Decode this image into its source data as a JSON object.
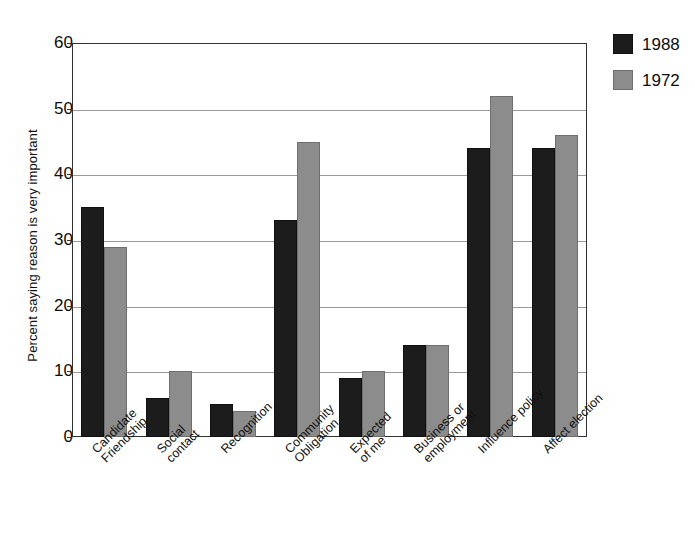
{
  "chart_data": {
    "type": "bar",
    "title": "",
    "xlabel": "",
    "ylabel": "Percent saying reason is very important",
    "ylim": [
      0,
      60
    ],
    "ytick_step": 10,
    "yticks": [
      "0",
      "10",
      "20",
      "30",
      "40",
      "50",
      "60"
    ],
    "grid": true,
    "legend_position": "right-top",
    "categories": [
      "Candidate\nFriendship",
      "Social\ncontact",
      "Recognition",
      "Community\nObligation",
      "Expected\nof me",
      "Business or\nemployment",
      "Influence policy",
      "Affect election"
    ],
    "series": [
      {
        "name": "1988",
        "color": "#1c1c1c",
        "values": [
          35,
          6,
          5,
          33,
          9,
          14,
          44,
          44
        ]
      },
      {
        "name": "1972",
        "color": "#8c8c8c",
        "values": [
          29,
          10,
          4,
          45,
          10,
          14,
          52,
          46
        ]
      }
    ]
  },
  "legend": {
    "items": [
      {
        "label": "1988",
        "swatch": "s1988"
      },
      {
        "label": "1972",
        "swatch": "s1972"
      }
    ]
  }
}
